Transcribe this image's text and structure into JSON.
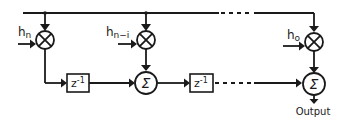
{
  "diagram": {
    "type": "FIR filter (transposed form) block diagram",
    "coefficients": [
      {
        "id": "hn",
        "label": "h",
        "subscript": "n"
      },
      {
        "id": "hn-i",
        "label": "h",
        "subscript": "n−i"
      },
      {
        "id": "h0",
        "label": "h",
        "subscript": "o"
      }
    ],
    "delays": [
      {
        "label": "z",
        "superscript": "-1"
      },
      {
        "label": "z",
        "superscript": "-1"
      }
    ],
    "sum_symbol": "Σ",
    "output_label": "Output",
    "colors": {
      "stroke": "#1a1a1a",
      "background": "#ffffff"
    }
  }
}
